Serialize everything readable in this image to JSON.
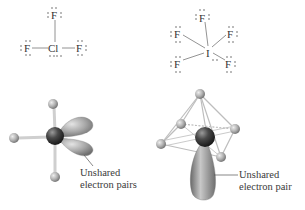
{
  "lewis_structures": [
    {
      "molecule": "ClF3",
      "central_atom": "Cl",
      "ligands": [
        "F",
        "F",
        "F"
      ],
      "central_lone_pairs": 2
    },
    {
      "molecule": "IF5",
      "central_atom": "I",
      "ligands": [
        "F",
        "F",
        "F",
        "F",
        "F"
      ],
      "central_lone_pairs": 1
    }
  ],
  "models": [
    {
      "geometry": "T-shaped",
      "label_line1": "Unshared",
      "label_line2": "electron pairs"
    },
    {
      "geometry": "square pyramidal",
      "label_line1": "Unshared",
      "label_line2": "electron pair"
    }
  ],
  "colors": {
    "bond": "#777777",
    "text": "#333333",
    "ligand_ball": "#b5b5b5",
    "central_ball": "#3a3a3a",
    "lobe": "#9a9a9a"
  }
}
